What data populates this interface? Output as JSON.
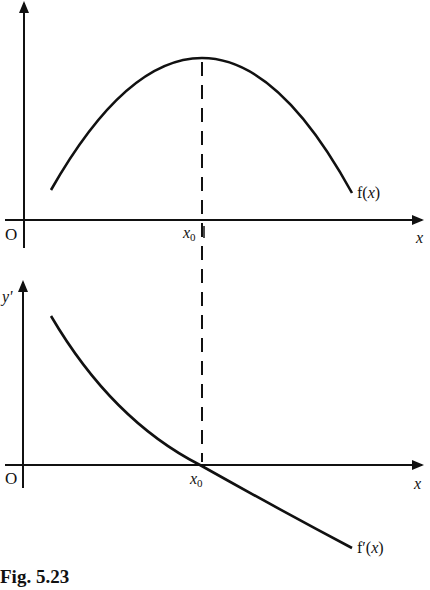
{
  "figure": {
    "caption": "Fig. 5.23",
    "top_plot": {
      "y_axis_label": "y",
      "x_axis_label": "x",
      "origin_label": "O",
      "x0_label": "x",
      "x0_subscript": "0",
      "curve_label": "f(x)"
    },
    "bottom_plot": {
      "y_axis_label": "y'",
      "x_axis_label": "x",
      "origin_label": "O",
      "x0_label": "x",
      "x0_subscript": "0",
      "curve_label": "f'(x)"
    }
  },
  "colors": {
    "ink": "#111111",
    "background": "#ffffff"
  }
}
